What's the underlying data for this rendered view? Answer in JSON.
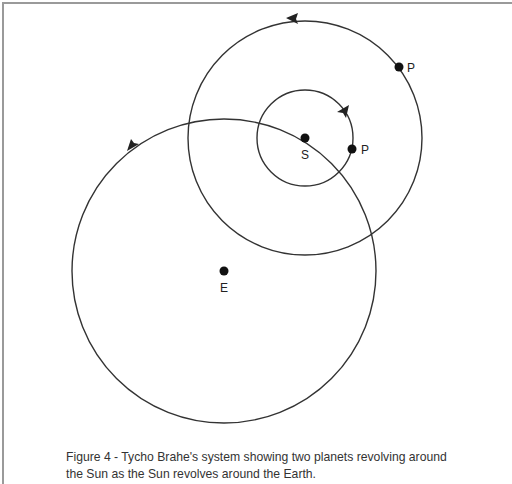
{
  "figure": {
    "caption_line1": "Figure 4 - Tycho Brahe's system showing two planets revolving around",
    "caption_line2": "the Sun as the Sun revolves around the Earth."
  },
  "bodies": {
    "sun_label": "S",
    "earth_label": "E",
    "inner_planet_label": "P",
    "outer_planet_label": "P"
  },
  "colors": {
    "stroke": "#333333",
    "dot": "#111111",
    "frame": "#9a9a9a"
  }
}
